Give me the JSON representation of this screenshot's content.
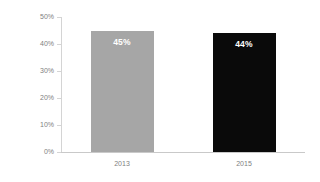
{
  "chart_data": {
    "type": "bar",
    "title": "",
    "xlabel": "",
    "ylabel": "Percent of respondents",
    "categories": [
      "2013",
      "2015"
    ],
    "values": [
      45,
      44
    ],
    "data_labels": [
      "45%",
      "44%"
    ],
    "bar_colors": [
      "#a6a6a6",
      "#0a0a0a"
    ],
    "ylim": [
      0,
      50
    ],
    "y_ticks": [
      0,
      10,
      20,
      30,
      40,
      50
    ],
    "y_tick_labels": [
      "0%",
      "10%",
      "20%",
      "30%",
      "40%",
      "50%"
    ],
    "grid": false,
    "legend": null,
    "axis_color": "#d4d4d4",
    "text_color": "#808080",
    "background": "#ffffff"
  }
}
